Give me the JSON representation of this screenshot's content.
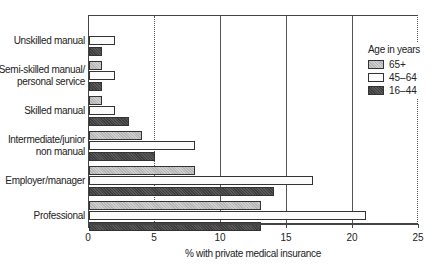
{
  "chart_data": {
    "type": "bar",
    "orientation": "horizontal",
    "title": "",
    "xlabel": "% with private medical insurance",
    "ylabel": "",
    "xlim": [
      0,
      25
    ],
    "xticks": [
      0,
      5,
      10,
      15,
      20,
      25
    ],
    "categories": [
      "Unskilled manual",
      "Semi-skilled manual/ personal service",
      "Skilled manual",
      "Intermediate/junior non manual",
      "Employer/manager",
      "Professional"
    ],
    "category_lines": [
      [
        "Unskilled manual"
      ],
      [
        "Semi-skilled manual/",
        "personal service"
      ],
      [
        "Skilled manual"
      ],
      [
        "Intermediate/junior",
        "non manual"
      ],
      [
        "Employer/manager"
      ],
      [
        "Professional"
      ]
    ],
    "legend_title": "Age in years",
    "legend_position": "upper right",
    "series": [
      {
        "name": "65+",
        "values": [
          0,
          1,
          1,
          4,
          8,
          13
        ]
      },
      {
        "name": "45–64",
        "values": [
          2,
          2,
          2,
          8,
          17,
          21
        ]
      },
      {
        "name": "16–44",
        "values": [
          1,
          1,
          3,
          5,
          14,
          13
        ]
      }
    ],
    "grid": "vertical lines at 5 (dotted), 10, 15, 20 (solid), 25 (dotted)"
  }
}
